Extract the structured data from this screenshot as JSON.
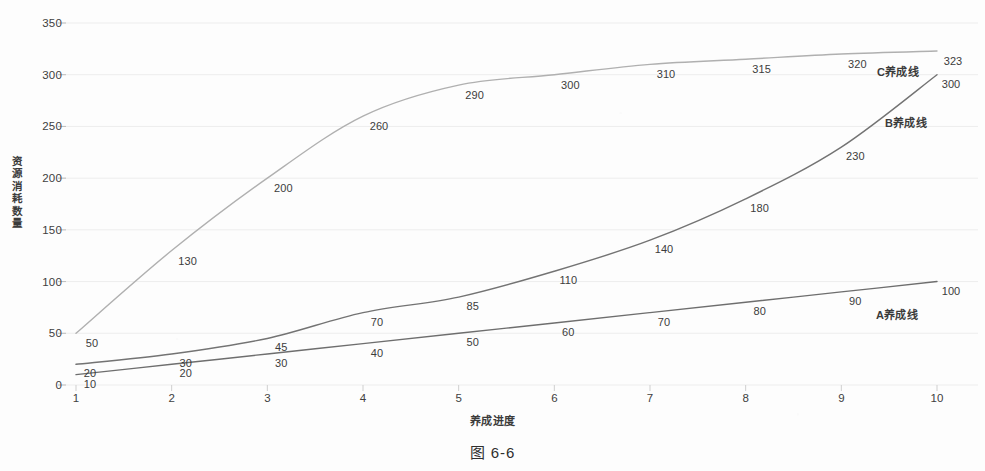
{
  "figure": {
    "caption": "图 6-6"
  },
  "chart_data": {
    "type": "line",
    "title": "",
    "xlabel": "养成进度",
    "ylabel": "资源消耗数量",
    "x": [
      1,
      2,
      3,
      4,
      5,
      6,
      7,
      8,
      9,
      10
    ],
    "xtick_labels": [
      "1",
      "2",
      "3",
      "4",
      "5",
      "6",
      "7",
      "8",
      "9",
      "10"
    ],
    "ytick_labels": [
      "0",
      "50",
      "100",
      "150",
      "200",
      "250",
      "300",
      "350"
    ],
    "yticks": [
      0,
      50,
      100,
      150,
      200,
      250,
      300,
      350
    ],
    "xlim": [
      1,
      10
    ],
    "ylim": [
      0,
      350
    ],
    "grid": "horizontal",
    "legend_position": "inline-annotation",
    "series": [
      {
        "name": "A养成线",
        "color": "#6e6e6e",
        "values": [
          10,
          20,
          30,
          40,
          50,
          60,
          70,
          80,
          90,
          100
        ],
        "annotation": "A养成线"
      },
      {
        "name": "B养成线",
        "color": "#737373",
        "values": [
          20,
          30,
          45,
          70,
          85,
          110,
          140,
          180,
          230,
          300
        ],
        "annotation": "B养成线"
      },
      {
        "name": "C养成线",
        "color": "#b0b0b0",
        "values": [
          50,
          130,
          200,
          260,
          290,
          300,
          310,
          315,
          320,
          323
        ],
        "annotation": "C养成线"
      }
    ]
  },
  "colors": {
    "axis": "#c8c8c8",
    "grid": "#ededed",
    "text": "#3c3c3c",
    "background": "#fdfdfd"
  }
}
